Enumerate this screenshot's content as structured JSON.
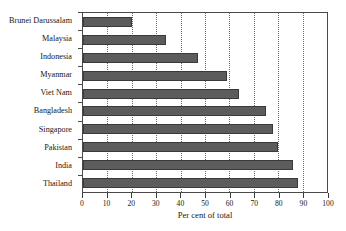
{
  "chart_data": {
    "type": "bar",
    "orientation": "horizontal",
    "title": "",
    "xlabel": "Per cent of total",
    "ylabel": "",
    "xlim": [
      0,
      100
    ],
    "xticks": [
      0,
      10,
      20,
      30,
      40,
      50,
      60,
      70,
      80,
      90,
      100
    ],
    "grid": "vertical-dotted",
    "legend": "none",
    "categories": [
      "Brunei Darussalam",
      "Malaysia",
      "Indonesia",
      "Myanmar",
      "Viet Nam",
      "Bangladesh",
      "Singapore",
      "Pakistan",
      "India",
      "Thailand"
    ],
    "values": [
      20,
      34,
      47,
      59,
      64,
      75,
      78,
      80,
      86,
      88
    ],
    "bar_color": "#5c5c5c",
    "bar_edge_color": "#3a3a3a",
    "axis_color": "#4a4a4a",
    "grid_color": "#6b6b6b",
    "background_color": "#ffffff"
  }
}
